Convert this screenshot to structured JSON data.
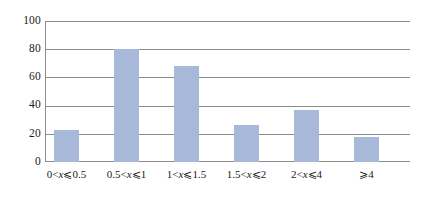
{
  "chart_data": {
    "type": "bar",
    "title": "",
    "subtitle": "",
    "xlabel": "",
    "ylabel": "",
    "categories": [
      "0<x⩽0.5",
      "0.5<x⩽1",
      "1<x⩽1.5",
      "1.5<x⩽2",
      "2<x⩽4",
      "⩾4"
    ],
    "category_parts": [
      {
        "pre": "0<",
        "var": "x",
        "post": "⩽0.5"
      },
      {
        "pre": "0.5<",
        "var": "x",
        "post": "⩽1"
      },
      {
        "pre": "1<",
        "var": "x",
        "post": "⩽1.5"
      },
      {
        "pre": "1.5<",
        "var": "x",
        "post": "⩽2"
      },
      {
        "pre": "2<",
        "var": "x",
        "post": "⩽4"
      },
      {
        "pre": "⩾4",
        "var": "",
        "post": ""
      }
    ],
    "values": [
      23,
      80,
      68,
      26,
      37,
      18
    ],
    "ylim": [
      0,
      100
    ],
    "yticks": [
      0,
      20,
      40,
      60,
      80,
      100
    ],
    "ytick_labels": [
      "0",
      "20",
      "40",
      "60",
      "80",
      "100"
    ],
    "grid": true,
    "legend": false,
    "legend_position": "none",
    "bar_color": "#a8b8d8",
    "grid_color": "#8c8c8c",
    "background_color": "#ffffff"
  }
}
